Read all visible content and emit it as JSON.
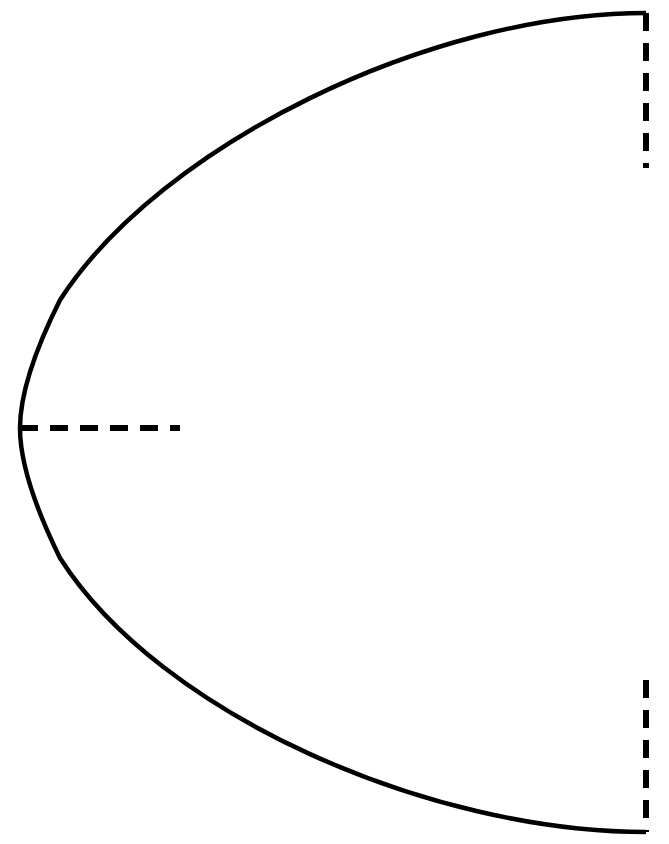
{
  "figure": {
    "type": "line-diagram",
    "canvas": {
      "width": 669,
      "height": 844,
      "background": "#ffffff"
    },
    "stroke_color": "#000000",
    "solid_stroke_width": 4.5,
    "dashed_stroke_width": 6,
    "dash_pattern": "18 12"
  },
  "geometry": {
    "curve": {
      "name": "parabolic-arc",
      "description": "Parabola opening to the right, vertex at left",
      "vertex": {
        "x": 20,
        "y": 428
      },
      "top_endpoint": {
        "x": 646,
        "y": 13
      },
      "bottom_endpoint": {
        "x": 646,
        "y": 832
      },
      "path": "M 646 13 C 430 13 160 145 60 300 C 30 360 20 400 20 428 C 20 456 30 497 60 558 C 160 715 430 832 646 832"
    },
    "dashed_segments": [
      {
        "name": "top-right-vertical-dashed",
        "x1": 646,
        "y1": 13,
        "x2": 646,
        "y2": 168
      },
      {
        "name": "axis-horizontal-dashed",
        "x1": 20,
        "y1": 428,
        "x2": 180,
        "y2": 428
      },
      {
        "name": "bottom-right-vertical-dashed",
        "x1": 646,
        "y1": 680,
        "x2": 646,
        "y2": 832
      }
    ]
  }
}
